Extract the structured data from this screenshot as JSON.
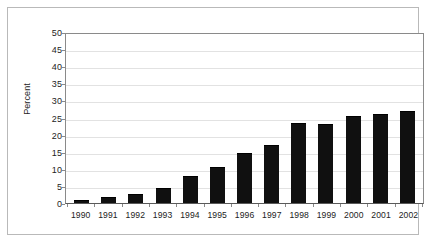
{
  "chart_data": {
    "type": "bar",
    "title": "",
    "subtitle": "",
    "xlabel": "",
    "ylabel": "Percent",
    "categories": [
      "1990",
      "1991",
      "1992",
      "1993",
      "1994",
      "1995",
      "1996",
      "1997",
      "1998",
      "1999",
      "2000",
      "2001",
      "2002"
    ],
    "values": [
      1,
      1.7,
      2.6,
      4.5,
      8,
      10.5,
      14.5,
      17,
      23.5,
      23,
      25.5,
      26,
      27
    ],
    "ylim": [
      0,
      50
    ],
    "ytick_step": 5,
    "yticks": [
      "50",
      "45",
      "40",
      "35",
      "30",
      "25",
      "20",
      "15",
      "10",
      "5",
      "0"
    ],
    "ytick_values": [
      50,
      45,
      40,
      35,
      30,
      25,
      20,
      15,
      10,
      5,
      0
    ],
    "grid": true,
    "grid_axis": "y",
    "legend": null,
    "legend_position": "none",
    "bar_color": "#101010",
    "grid_color": "#e2e2e2",
    "axis_color": "#8a8a8a",
    "text_color": "#232323",
    "background_color": "#ffffff",
    "annotations": []
  }
}
